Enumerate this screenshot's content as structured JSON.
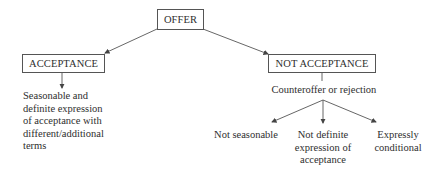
{
  "diagram": {
    "root": {
      "label": "OFFER"
    },
    "branches": [
      {
        "label": "ACCEPTANCE",
        "description": [
          "Seasonable and",
          "definite expression",
          "of acceptance with",
          "different/additional",
          "terms"
        ]
      },
      {
        "label": "NOT ACCEPTANCE",
        "sub_label": "Counteroffer or rejection",
        "children": [
          {
            "lines": [
              "Not seasonable"
            ]
          },
          {
            "lines": [
              "Not definite",
              "expression of",
              "acceptance"
            ]
          },
          {
            "lines": [
              "Expressly",
              "conditional"
            ]
          }
        ]
      }
    ],
    "colors": {
      "line": "#555555",
      "text": "#2e2e2e",
      "background": "#ffffff"
    }
  }
}
